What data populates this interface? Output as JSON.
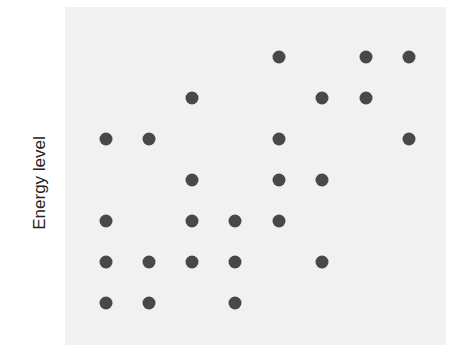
{
  "chart_data": {
    "type": "scatter",
    "title": "",
    "xlabel": "",
    "ylabel": "Energy level",
    "grid": false,
    "legend": null,
    "dot_color": "#484848",
    "panel_color": "#f1f1f1",
    "columns": 8,
    "rows": 7,
    "note": "Dot matrix; x = column index 1-8 (left to right), y = row index 1-7 (bottom to top)",
    "points": [
      {
        "x": 5,
        "y": 7
      },
      {
        "x": 7,
        "y": 7
      },
      {
        "x": 8,
        "y": 7
      },
      {
        "x": 3,
        "y": 6
      },
      {
        "x": 6,
        "y": 6
      },
      {
        "x": 7,
        "y": 6
      },
      {
        "x": 1,
        "y": 5
      },
      {
        "x": 2,
        "y": 5
      },
      {
        "x": 5,
        "y": 5
      },
      {
        "x": 8,
        "y": 5
      },
      {
        "x": 3,
        "y": 4
      },
      {
        "x": 5,
        "y": 4
      },
      {
        "x": 6,
        "y": 4
      },
      {
        "x": 1,
        "y": 3
      },
      {
        "x": 3,
        "y": 3
      },
      {
        "x": 4,
        "y": 3
      },
      {
        "x": 5,
        "y": 3
      },
      {
        "x": 1,
        "y": 2
      },
      {
        "x": 2,
        "y": 2
      },
      {
        "x": 3,
        "y": 2
      },
      {
        "x": 4,
        "y": 2
      },
      {
        "x": 6,
        "y": 2
      },
      {
        "x": 1,
        "y": 1
      },
      {
        "x": 2,
        "y": 1
      },
      {
        "x": 4,
        "y": 1
      }
    ]
  },
  "layout": {
    "col_px": [
      106,
      149,
      192,
      235,
      279,
      322,
      366,
      409
    ],
    "row_px_top_to_bottom": [
      57,
      98,
      139,
      180,
      221,
      262,
      303
    ]
  }
}
